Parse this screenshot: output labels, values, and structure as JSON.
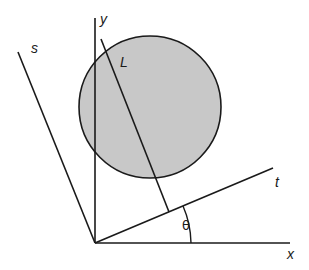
{
  "diagram": {
    "labels": {
      "y": "y",
      "x": "x",
      "s": "s",
      "t": "t",
      "L": "L",
      "theta": "θ"
    },
    "colors": {
      "stroke": "#1a1a1a",
      "disk_fill": "#c8c8c8",
      "background": "#ffffff"
    },
    "origin": [
      95,
      243
    ],
    "disk": {
      "cx": 150,
      "cy": 107,
      "r": 71
    },
    "axes": {
      "x_axis": {
        "from": [
          95,
          243
        ],
        "to": [
          290,
          243
        ]
      },
      "y_axis": {
        "from": [
          95,
          18
        ],
        "to": [
          95,
          243
        ]
      },
      "t_axis": {
        "from": [
          95,
          243
        ],
        "to": [
          273,
          168
        ]
      },
      "s_axis": {
        "from": [
          18,
          52
        ],
        "to": [
          95,
          243
        ]
      }
    },
    "line_L": {
      "from": [
        101,
        39
      ],
      "to": [
        169,
        212
      ]
    },
    "angle_arc_label": "θ"
  }
}
